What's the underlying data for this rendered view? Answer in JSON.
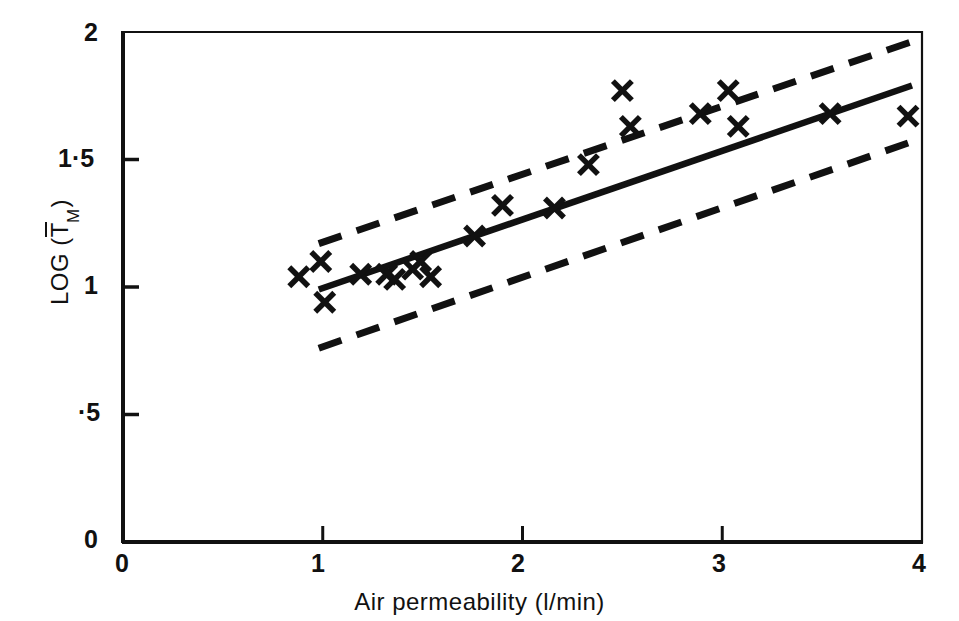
{
  "chart_data": {
    "type": "scatter",
    "title": "",
    "xlabel": "Air permeability (l/min)",
    "ylabel": "LOG (T̅M)",
    "ylabel_parts": {
      "prefix": "LOG (",
      "symbol": "T",
      "subscript": "M",
      "suffix": ")"
    },
    "xlim": [
      0,
      4
    ],
    "ylim": [
      0,
      2
    ],
    "xticks": [
      0,
      1,
      2,
      3,
      4
    ],
    "xtick_labels": [
      "0",
      "1",
      "2",
      "3",
      "4"
    ],
    "yticks": [
      0,
      0.5,
      1,
      1.5,
      2
    ],
    "ytick_labels": [
      "0",
      "·5",
      "1",
      "1·5",
      "2"
    ],
    "grid": false,
    "legend": "none",
    "marker": "x",
    "points": [
      {
        "x": 0.88,
        "y": 1.04
      },
      {
        "x": 0.99,
        "y": 1.1
      },
      {
        "x": 1.01,
        "y": 0.94
      },
      {
        "x": 1.19,
        "y": 1.05
      },
      {
        "x": 1.32,
        "y": 1.05
      },
      {
        "x": 1.36,
        "y": 1.03
      },
      {
        "x": 1.45,
        "y": 1.07
      },
      {
        "x": 1.49,
        "y": 1.1
      },
      {
        "x": 1.54,
        "y": 1.04
      },
      {
        "x": 1.76,
        "y": 1.2
      },
      {
        "x": 1.9,
        "y": 1.32
      },
      {
        "x": 2.16,
        "y": 1.31
      },
      {
        "x": 2.33,
        "y": 1.48
      },
      {
        "x": 2.5,
        "y": 1.77
      },
      {
        "x": 2.54,
        "y": 1.63
      },
      {
        "x": 2.89,
        "y": 1.68
      },
      {
        "x": 3.03,
        "y": 1.77
      },
      {
        "x": 3.08,
        "y": 1.63
      },
      {
        "x": 3.54,
        "y": 1.68
      },
      {
        "x": 3.93,
        "y": 1.67
      }
    ],
    "series": [
      {
        "name": "regression-line",
        "style": "solid",
        "x": [
          0.98,
          2.83
        ],
        "y": [
          0.99,
          1.49
        ],
        "x_full": [
          0.98,
          3.95
        ],
        "y_full": [
          0.99,
          1.79
        ]
      },
      {
        "name": "upper-confidence-band",
        "style": "dashed",
        "x": [
          0.98,
          3.98
        ],
        "y": [
          1.17,
          1.97
        ]
      },
      {
        "name": "lower-confidence-band",
        "style": "dashed",
        "x": [
          0.98,
          3.95
        ],
        "y": [
          0.76,
          1.57
        ]
      }
    ]
  },
  "axes": {
    "x_tick_labels": [
      "0",
      "1",
      "2",
      "3",
      "4"
    ],
    "y_tick_labels": [
      "0",
      "·5",
      "1",
      "1·5",
      "2"
    ],
    "x_title": "Air permeability (l/min)",
    "y_title_prefix": "LOG (",
    "y_title_symbol": "T",
    "y_title_sub": "M",
    "y_title_suffix": ")"
  },
  "colors": {
    "ink": "#111111",
    "background": "#ffffff"
  }
}
